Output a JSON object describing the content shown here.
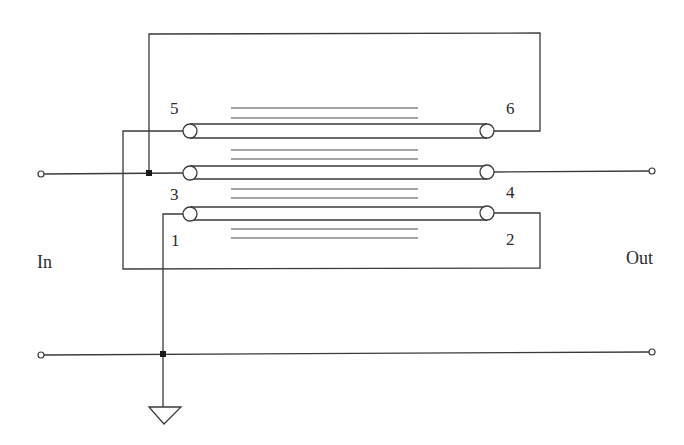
{
  "diagram": {
    "type": "transmission-line transformer schematic",
    "labels": {
      "input": "In",
      "output": "Out",
      "pins": {
        "p1": "1",
        "p2": "2",
        "p3": "3",
        "p4": "4",
        "p5": "5",
        "p6": "6"
      }
    },
    "transmission_lines": [
      {
        "name": "line-5-6",
        "left_pin": "5",
        "right_pin": "6"
      },
      {
        "name": "line-3-4",
        "left_pin": "3",
        "right_pin": "4"
      },
      {
        "name": "line-1-2",
        "left_pin": "1",
        "right_pin": "2"
      }
    ],
    "core_lines_per_gap": 2,
    "ground_symbol": "ground-triangle",
    "colors": {
      "line": "#3a3a3a",
      "junction": "#1a1a1a",
      "background": "#ffffff"
    }
  }
}
